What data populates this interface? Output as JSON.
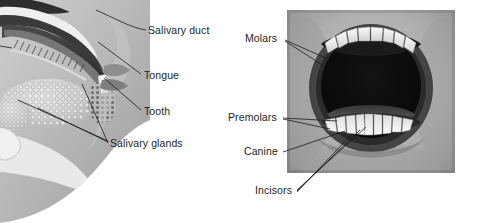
{
  "figure": {
    "background_color": "#ffffff",
    "text_color": "#231f20",
    "leader_line_color": "#1a1a1a"
  },
  "left_panel": {
    "name": "sagittal-section-diagram",
    "description": "Grayscale sagittal (side) section of the human oral cavity showing palate, tongue, teeth, lips and salivary glands",
    "labels": [
      {
        "id": "salivary-duct",
        "text": "Salivary duct",
        "x": 148,
        "y": 25
      },
      {
        "id": "tongue",
        "text": "Tongue",
        "x": 144,
        "y": 70
      },
      {
        "id": "tooth",
        "text": "Tooth",
        "x": 144,
        "y": 106
      },
      {
        "id": "salivary-glands",
        "text": "Salivary glands",
        "x": 110,
        "y": 138
      }
    ]
  },
  "right_panel": {
    "name": "open-mouth-photograph",
    "description": "Black and white photograph of an open mouth showing upper and lower tooth rows",
    "frame": {
      "x": 287,
      "y": 10,
      "width": 168,
      "height": 163
    },
    "labels": [
      {
        "id": "molars",
        "text": "Molars",
        "x": 245,
        "y": 33
      },
      {
        "id": "premolars",
        "text": "Premolars",
        "x": 228,
        "y": 112
      },
      {
        "id": "canine",
        "text": "Canine",
        "x": 244,
        "y": 146
      },
      {
        "id": "incisors",
        "text": "Incisors",
        "x": 255,
        "y": 185
      }
    ]
  },
  "tooth_types": [
    "Molars",
    "Premolars",
    "Canine",
    "Incisors"
  ],
  "structures": [
    "Salivary duct",
    "Tongue",
    "Tooth",
    "Salivary glands"
  ]
}
